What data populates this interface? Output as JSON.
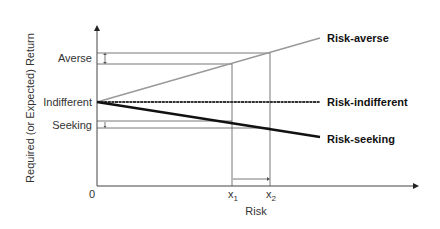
{
  "diagram": {
    "type": "risk-return line diagram",
    "y_axis_label": "Required (or Expected) Return",
    "x_axis_label": "Risk",
    "origin_label": "0",
    "y_levels": {
      "averse": "Averse",
      "indifferent": "Indifferent",
      "seeking": "Seeking"
    },
    "x_markers": {
      "x1": "x",
      "x1_sub": "1",
      "x2": "x",
      "x2_sub": "2"
    },
    "lines": [
      {
        "name": "Risk-averse",
        "color": "#9a9a9a",
        "direction": "upward"
      },
      {
        "name": "Risk-indifferent",
        "color": "#333333",
        "direction": "flat"
      },
      {
        "name": "Risk-seeking",
        "color": "#111111",
        "direction": "downward"
      }
    ]
  }
}
